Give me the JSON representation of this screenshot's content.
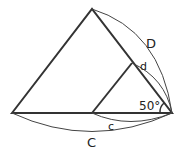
{
  "diagram": {
    "labels": {
      "D": "D",
      "d": "d",
      "C": "C",
      "c": "c",
      "angle": "50°"
    },
    "colors": {
      "stroke": "#333333",
      "background": "#ffffff"
    },
    "points": {
      "outer_left": [
        12,
        113
      ],
      "outer_apex": [
        92,
        9
      ],
      "pivot": [
        172,
        113
      ],
      "inner_left": [
        92,
        113
      ],
      "inner_apex": [
        132,
        63
      ]
    }
  }
}
